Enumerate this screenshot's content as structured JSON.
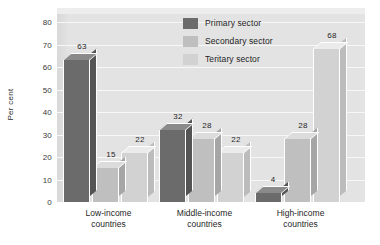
{
  "chart_data": {
    "type": "bar",
    "title": "",
    "subtitle": "",
    "xlabel": "",
    "ylabel": "Per cent",
    "ylim": [
      0,
      80
    ],
    "ytick_step": 10,
    "yticks": [
      80,
      70,
      60,
      50,
      40,
      30,
      20,
      10,
      0
    ],
    "grid": true,
    "grid_axis": "y",
    "legend_position": "top-right-inside",
    "three_d": true,
    "categories": [
      "Low-income countries",
      "Middle-income countries",
      "High-income countries"
    ],
    "category_lines": [
      [
        "Low-income",
        "countries"
      ],
      [
        "Middle-income",
        "countries"
      ],
      [
        "High-income",
        "countries"
      ]
    ],
    "series": [
      {
        "name": "Primary sector",
        "values": [
          63,
          32,
          4
        ],
        "color": "#6b6b6b"
      },
      {
        "name": "Secondary sector",
        "values": [
          15,
          28,
          28
        ],
        "color": "#bfbfbf"
      },
      {
        "name": "Teritary sector",
        "values": [
          22,
          22,
          68
        ],
        "color": "#d2d2d2"
      }
    ],
    "data_labels": [
      [
        63,
        15,
        22
      ],
      [
        32,
        28,
        22
      ],
      [
        4,
        28,
        68
      ]
    ]
  },
  "legend": {
    "items": [
      {
        "label": "Primary sector"
      },
      {
        "label": "Secondary sector"
      },
      {
        "label": "Teritary sector"
      }
    ]
  },
  "colors": {
    "plot_background": "#e3e3e3",
    "gridline": "#f7f7f7",
    "page_background": "#ffffff",
    "primary": "#6b6b6b",
    "secondary": "#bfbfbf",
    "tertiary": "#d2d2d2",
    "primary_side": "#545454",
    "secondary_side": "#a6a6a6",
    "tertiary_side": "#bcbcbc",
    "primary_top": "#8a8a8a",
    "secondary_top": "#dcdcdc",
    "tertiary_top": "#ebebeb",
    "text": "#1f1f1f"
  }
}
